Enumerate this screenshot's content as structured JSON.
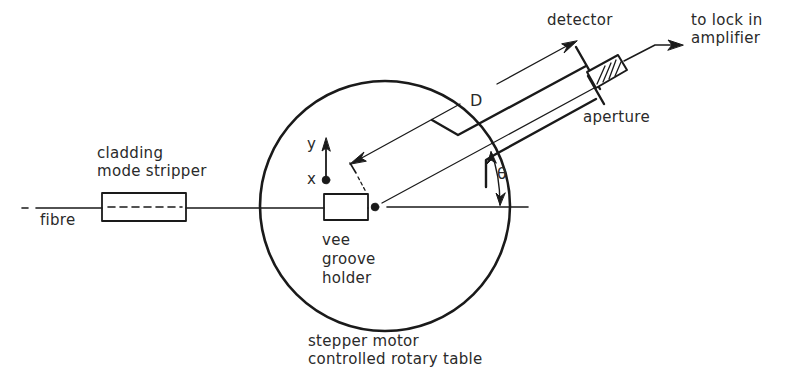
{
  "figure": {
    "type": "experimental setup diagram",
    "labels": {
      "detector": "detector",
      "lock_in_line1": "to lock in",
      "lock_in_line2": "amplifier",
      "aperture": "aperture",
      "cladding_line1": "cladding",
      "cladding_line2": "mode stripper",
      "fibre": "fibre",
      "distance": "D",
      "angle": "θ",
      "axis_y": "y",
      "axis_x": "x",
      "holder_line1": "vee",
      "holder_line2": "groove",
      "holder_line3": "holder",
      "table_line1": "stepper motor",
      "table_line2": "controlled rotary table"
    },
    "colors": {
      "ink": "#1a1a1a",
      "text": "#2a2a2a",
      "background": "#ffffff"
    }
  }
}
